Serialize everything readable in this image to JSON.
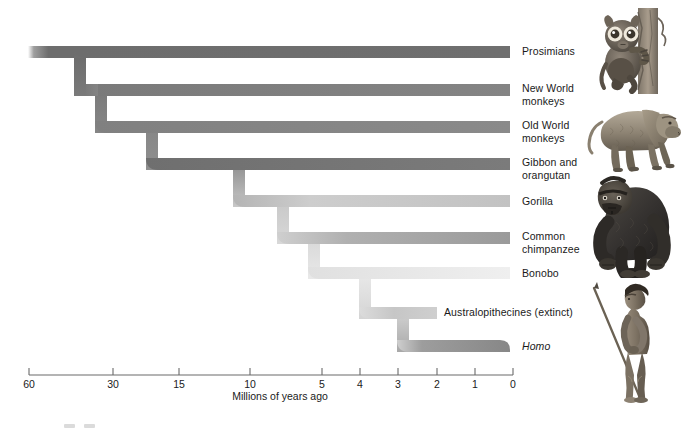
{
  "figure": {
    "background": "#ffffff"
  },
  "axis": {
    "title": "Millions of years ago",
    "unit": "Millions of years ago",
    "direction": "right-to-left",
    "ticks": [
      {
        "label": "60",
        "value": 60,
        "x": 29
      },
      {
        "label": "30",
        "value": 30,
        "x": 113
      },
      {
        "label": "15",
        "value": 15,
        "x": 179
      },
      {
        "label": "10",
        "value": 10,
        "x": 250
      },
      {
        "label": "5",
        "value": 5,
        "x": 322
      },
      {
        "label": "4",
        "value": 4,
        "x": 360
      },
      {
        "label": "3",
        "value": 3,
        "x": 398
      },
      {
        "label": "2",
        "value": 2,
        "x": 437
      },
      {
        "label": "1",
        "value": 1,
        "x": 475
      },
      {
        "label": "0",
        "value": 0,
        "x": 513
      }
    ],
    "line_y": 375,
    "tick_height": 7
  },
  "branches": [
    {
      "id": "prosimians",
      "label": "Prosimians",
      "y": 52,
      "color": "#6d6d6d",
      "split_mya": 60,
      "end_x": 510,
      "italic": false,
      "label_x": 522,
      "label_y": 46
    },
    {
      "id": "new-world",
      "label": "New World\nmonkeys",
      "y": 90,
      "color": "#7d7d7d",
      "split_mya": 35,
      "end_x": 510,
      "italic": false,
      "label_x": 522,
      "label_y": 83
    },
    {
      "id": "old-world",
      "label": "Old World\nmonkeys",
      "y": 127,
      "color": "#858585",
      "split_mya": 25,
      "end_x": 510,
      "italic": false,
      "label_x": 522,
      "label_y": 120
    },
    {
      "id": "gibbon-orangutan",
      "label": "Gibbon and\norangutan",
      "y": 164,
      "color": "#767676",
      "split_mya": 18,
      "end_x": 510,
      "italic": false,
      "label_x": 522,
      "label_y": 157
    },
    {
      "id": "gorilla",
      "label": "Gorilla",
      "y": 201,
      "color": "#c2c2c2",
      "split_mya": 8,
      "end_x": 510,
      "italic": false,
      "label_x": 522,
      "label_y": 196
    },
    {
      "id": "common-chimpanzee",
      "label": "Common\nchimpanzee",
      "y": 238,
      "color": "#9d9d9d",
      "split_mya": 6,
      "end_x": 510,
      "italic": false,
      "label_x": 522,
      "label_y": 231
    },
    {
      "id": "bonobo",
      "label": "Bonobo",
      "y": 273,
      "color": "#ececec",
      "split_mya": 5,
      "end_x": 510,
      "italic": false,
      "label_x": 522,
      "label_y": 268
    },
    {
      "id": "australopithecines",
      "label": "Australopithecines (extinct)",
      "y": 313,
      "color": "#c9c9c9",
      "split_mya": 4,
      "end_x": 437,
      "italic": false,
      "label_x": 444,
      "label_y": 307
    },
    {
      "id": "homo",
      "label": "Homo",
      "y": 346,
      "color": "#8a8a8a",
      "split_mya": 2.5,
      "end_x": 510,
      "italic": true,
      "label_x": 522,
      "label_y": 340
    }
  ],
  "illustrations": [
    {
      "id": "tarsier",
      "name": "prosimian-tarsier-illustration",
      "x": 592,
      "y": 8,
      "w": 78,
      "h": 86
    },
    {
      "id": "baboon",
      "name": "old-world-monkey-baboon-illustration",
      "x": 586,
      "y": 88,
      "w": 96,
      "h": 82
    },
    {
      "id": "gorilla-img",
      "name": "gorilla-illustration",
      "x": 586,
      "y": 170,
      "w": 92,
      "h": 105
    },
    {
      "id": "early-human",
      "name": "early-human-illustration",
      "x": 592,
      "y": 278,
      "w": 84,
      "h": 125
    }
  ],
  "colors": {
    "branch_darkest": "#6d6d6d",
    "branch_mid": "#9d9d9d",
    "branch_lightest": "#ececec",
    "axis_line": "#6a6a6a",
    "text": "#1a1a1a"
  }
}
